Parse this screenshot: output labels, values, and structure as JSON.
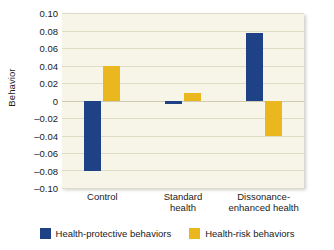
{
  "chart_data": {
    "type": "bar",
    "title": "",
    "xlabel": "",
    "ylabel": "Behavior",
    "ylim": [
      -0.1,
      0.1
    ],
    "ytick_labels": [
      "0.10",
      "0.08",
      "0.06",
      "0.04",
      "0.02",
      "0",
      "–0.02",
      "–0.04",
      "–0.06",
      "–0.08",
      "–0.10"
    ],
    "ytick_values": [
      0.1,
      0.08,
      0.06,
      0.04,
      0.02,
      0,
      -0.02,
      -0.04,
      -0.06,
      -0.08,
      -0.1
    ],
    "grid": true,
    "legend_position": "bottom",
    "categories": [
      "Control",
      "Standard health",
      "Dissonance-enhanced health"
    ],
    "category_lines": [
      [
        "Control",
        ""
      ],
      [
        "Standard",
        "health"
      ],
      [
        "Dissonance-",
        "enhanced health"
      ]
    ],
    "series": [
      {
        "name": "Health-protective behaviors",
        "color": "#1f4287",
        "values": [
          -0.081,
          -0.004,
          0.077
        ]
      },
      {
        "name": "Health-risk behaviors",
        "color": "#ebb71f",
        "values": [
          0.039,
          0.009,
          -0.041
        ]
      }
    ]
  },
  "legend": {
    "items": [
      {
        "label": "Health-protective behaviors",
        "swatch": "protective"
      },
      {
        "label": "Health-risk behaviors",
        "swatch": "risk"
      }
    ]
  },
  "colors": {
    "protective": "#1f4287",
    "risk": "#ebb71f",
    "plot_background": "#f7f5e7",
    "gridline": "#dedbc6",
    "text": "#1a1a1a"
  }
}
